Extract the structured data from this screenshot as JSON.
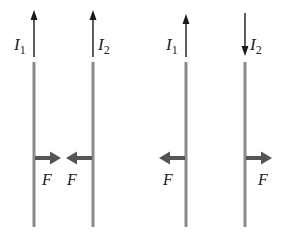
{
  "diagram": {
    "colors": {
      "wire": "#8a8a8a",
      "force_arrow": "#555555",
      "current_arrow": "#1a1a1a",
      "text": "#222222",
      "background": "#ffffff"
    },
    "panels": [
      {
        "name": "parallel-currents",
        "wires": [
          {
            "x": 34,
            "current_label": "I",
            "current_sub": "1",
            "current_direction": "up",
            "label_side": "left",
            "force_label": "F",
            "force_direction": "right"
          },
          {
            "x": 93,
            "current_label": "I",
            "current_sub": "2",
            "current_direction": "up",
            "label_side": "right",
            "force_label": "F",
            "force_direction": "left"
          }
        ]
      },
      {
        "name": "antiparallel-currents",
        "wires": [
          {
            "x": 186,
            "current_label": "I",
            "current_sub": "1",
            "current_direction": "up",
            "label_side": "left",
            "force_label": "F",
            "force_direction": "left"
          },
          {
            "x": 245,
            "current_label": "I",
            "current_sub": "2",
            "current_direction": "down",
            "label_side": "right",
            "force_label": "F",
            "force_direction": "right"
          }
        ]
      }
    ],
    "labels": {
      "i1_a": "I",
      "i1_a_sub": "1",
      "i2_a": "I",
      "i2_a_sub": "2",
      "i1_b": "I",
      "i1_b_sub": "1",
      "i2_b": "I",
      "i2_b_sub": "2",
      "f1": "F",
      "f2": "F",
      "f3": "F",
      "f4": "F"
    }
  }
}
